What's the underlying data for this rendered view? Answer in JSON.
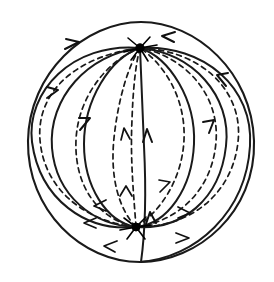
{
  "figure": {
    "background_color": "#ffffff",
    "ink_color": "#1a1a1a"
  },
  "sphere": {
    "label": "sphere-outline",
    "center_x": 141,
    "center_y": 142,
    "radius_x": 113,
    "radius_y": 120,
    "stroke_color": "#1a1a1a",
    "stroke_width": 2.1
  },
  "nodes": [
    {
      "name": "sink-node-top",
      "role": "sink",
      "x": 140,
      "y": 48,
      "radius": 4.2,
      "color": "#000000",
      "spike_count": 9
    },
    {
      "name": "source-node-bottom",
      "role": "source",
      "x": 136,
      "y": 227,
      "radius": 4.0,
      "color": "#000000",
      "spike_count": 9
    }
  ],
  "trajectories": {
    "solid_count": 7,
    "dashed_count": 7,
    "solid_style": "front hemisphere, visible",
    "dashed_style": "back hemisphere, hidden",
    "dash_pattern": "5 4.2",
    "flow_direction": "from bottom source node toward top sink node"
  },
  "arrowheads": {
    "total": 16,
    "length": 9,
    "half_angle_degrees": 20,
    "color": "#111111"
  }
}
